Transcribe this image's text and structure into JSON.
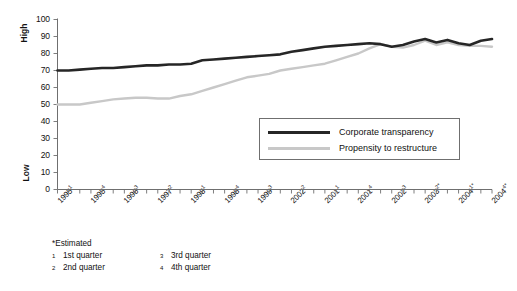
{
  "chart_data": {
    "type": "line",
    "title": "",
    "xlabel": "",
    "ylabel": "",
    "ylim": [
      0,
      100
    ],
    "ytick_values": [
      100,
      90,
      80,
      70,
      60,
      50,
      40,
      30,
      20,
      10,
      0
    ],
    "y_axis_high_label": "High",
    "y_axis_low_label": "Low",
    "grid": false,
    "legend_position": "inside-right",
    "x_axis_tick_count": 40,
    "categories": [
      "1995 Q1",
      "1995 Q2",
      "1995 Q3",
      "1995 Q4",
      "1996 Q1",
      "1996 Q2",
      "1996 Q3",
      "1996 Q4",
      "1997 Q1",
      "1997 Q2",
      "1997 Q3",
      "1997 Q4",
      "1998 Q1",
      "1998 Q2",
      "1998 Q3",
      "1998 Q4",
      "1999 Q1",
      "1999 Q2",
      "1999 Q3",
      "1999 Q4",
      "2000 Q1",
      "2000 Q2",
      "2000 Q3",
      "2000 Q4",
      "2001 Q1",
      "2001 Q2",
      "2001 Q3",
      "2001 Q4",
      "2002 Q1",
      "2002 Q2",
      "2002 Q3",
      "2002 Q4",
      "2003 Q1",
      "2003 Q2",
      "2003 Q3",
      "2003 Q4",
      "2004 Q1",
      "2004 Q2",
      "2004 Q3",
      "2004 Q4"
    ],
    "xtick_labels": [
      {
        "year": "1995",
        "quarter": "1",
        "estimated": false
      },
      {
        "year": "1995",
        "quarter": "4",
        "estimated": false
      },
      {
        "year": "1996",
        "quarter": "3",
        "estimated": false
      },
      {
        "year": "1997",
        "quarter": "2",
        "estimated": false
      },
      {
        "year": "1998",
        "quarter": "1",
        "estimated": false
      },
      {
        "year": "1998",
        "quarter": "4",
        "estimated": false
      },
      {
        "year": "1999",
        "quarter": "3",
        "estimated": false
      },
      {
        "year": "2002",
        "quarter": "2",
        "estimated": false
      },
      {
        "year": "2001",
        "quarter": "1",
        "estimated": false
      },
      {
        "year": "2001",
        "quarter": "4",
        "estimated": false
      },
      {
        "year": "2002",
        "quarter": "3",
        "estimated": false
      },
      {
        "year": "2003",
        "quarter": "2",
        "estimated": true
      },
      {
        "year": "2004",
        "quarter": "1",
        "estimated": true
      },
      {
        "year": "2004",
        "quarter": "4",
        "estimated": true
      }
    ],
    "series": [
      {
        "name": "Corporate transparency",
        "color": "#262626",
        "values": [
          70,
          70,
          70.5,
          71,
          71.5,
          71.5,
          72,
          72.5,
          73,
          73,
          73.5,
          73.5,
          74,
          76,
          76.5,
          77,
          77.5,
          78,
          78.5,
          79,
          79.5,
          81,
          82,
          83,
          84,
          84.5,
          85,
          85.5,
          86,
          85.5,
          84,
          85,
          87,
          88.5,
          86.5,
          88,
          86,
          85,
          87.5,
          88.5
        ]
      },
      {
        "name": "Propensity to restructure",
        "color": "#c8c8c8",
        "values": [
          50,
          50,
          50,
          51,
          52,
          53,
          53.5,
          54,
          54,
          53.5,
          53.5,
          55,
          56,
          58,
          60,
          62,
          64,
          66,
          67,
          68,
          70,
          71,
          72,
          73,
          74,
          76,
          78,
          80,
          83,
          85.5,
          84,
          83.5,
          85,
          87.5,
          85,
          86.5,
          85,
          84.5,
          84.5,
          84
        ]
      }
    ]
  },
  "legend": {
    "items": [
      {
        "label": "Corporate transparency"
      },
      {
        "label": "Propensity to restructure"
      }
    ]
  },
  "footnotes": {
    "estimated": "*Estimated",
    "entries": [
      {
        "marker": "1",
        "text": "1st quarter"
      },
      {
        "marker": "3",
        "text": "3rd quarter"
      },
      {
        "marker": "2",
        "text": "2nd quarter"
      },
      {
        "marker": "4",
        "text": "4th quarter"
      }
    ]
  }
}
